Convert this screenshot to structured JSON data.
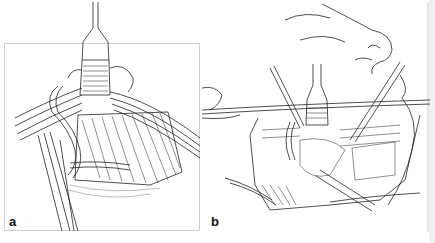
{
  "figure": {
    "panels": [
      {
        "label": "a",
        "description": "Surgical line drawing: retractor held vertically at top, bands of muscle and vessels crossing, looped vessel on left, forceps at lower left"
      },
      {
        "label": "b",
        "description": "Surgical line drawing: patient head tilted back, neck incision with retractors and instruments exposing neck structures"
      }
    ],
    "colors": {
      "ink": "#222222",
      "frame": "#cfcfcf",
      "background": "#ffffff",
      "strip": "#f0f0f0"
    }
  }
}
